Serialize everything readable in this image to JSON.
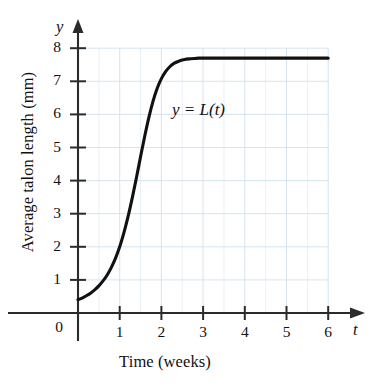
{
  "figure": {
    "background_color": "#ffffff",
    "grid_color": "#cfe0ee",
    "axis_color": "#2b2b2b",
    "curve_color": "#111111"
  },
  "axes": {
    "y_variable": "y",
    "x_variable": "t",
    "x_axis_title": "Time (weeks)",
    "y_axis_title": "Average talon length (mm)",
    "origin_label": "0",
    "x_ticks": [
      "1",
      "2",
      "3",
      "4",
      "5",
      "6"
    ],
    "y_ticks": [
      "1",
      "2",
      "3",
      "4",
      "5",
      "6",
      "7",
      "8"
    ]
  },
  "annotations": {
    "curve_label": "y = L(t)"
  },
  "chart_data": {
    "type": "line",
    "title": "",
    "xlabel": "Time (weeks)",
    "ylabel": "Average talon length (mm)",
    "xlim": [
      0,
      6
    ],
    "ylim": [
      0,
      8
    ],
    "xticks": [
      1,
      2,
      3,
      4,
      5,
      6
    ],
    "yticks": [
      1,
      2,
      3,
      4,
      5,
      6,
      7,
      8
    ],
    "grid": true,
    "grid_x_step": 0.5,
    "grid_y_step": 1,
    "legend": "none",
    "annotations": [
      {
        "text": "y = L(t)",
        "x": 2.5,
        "y": 6.5
      }
    ],
    "series": [
      {
        "name": "y = L(t)",
        "label": "y = L(t)",
        "color": "#111111",
        "x": [
          0,
          0.1,
          0.2,
          0.3,
          0.4,
          0.5,
          0.6,
          0.7,
          0.8,
          0.9,
          1.0,
          1.1,
          1.2,
          1.3,
          1.4,
          1.5,
          1.6,
          1.7,
          1.8,
          1.9,
          2.0,
          2.1,
          2.2,
          2.3,
          2.4,
          2.5,
          2.6,
          2.7,
          2.8,
          2.9,
          3.0,
          3.2,
          3.4,
          3.6,
          3.8,
          4.0,
          4.5,
          5.0,
          5.5,
          6.0
        ],
        "y": [
          0.4,
          0.45,
          0.52,
          0.6,
          0.7,
          0.82,
          0.97,
          1.15,
          1.38,
          1.66,
          2.0,
          2.42,
          2.91,
          3.47,
          4.08,
          4.72,
          5.34,
          5.91,
          6.4,
          6.79,
          7.08,
          7.29,
          7.44,
          7.54,
          7.6,
          7.64,
          7.67,
          7.68,
          7.69,
          7.7,
          7.7,
          7.7,
          7.7,
          7.7,
          7.7,
          7.7,
          7.7,
          7.7,
          7.7,
          7.7
        ]
      }
    ]
  }
}
